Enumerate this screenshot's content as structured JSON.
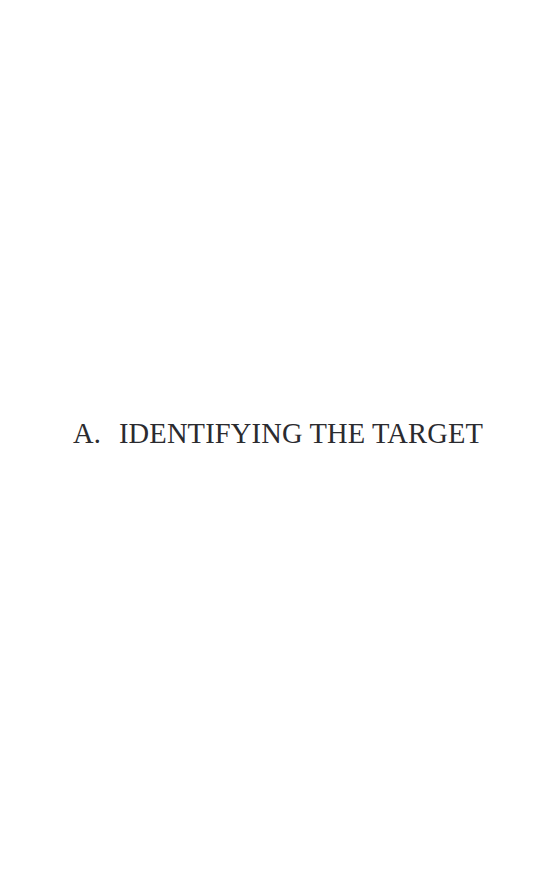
{
  "page": {
    "background_color": "#ffffff",
    "text_color": "#2b2b2f",
    "width": 542,
    "height": 877
  },
  "section_heading": {
    "enumerator": "A.",
    "title": "IDENTIFYING THE TARGET",
    "full_line": "A.   IDENTIFYING THE TARGET"
  }
}
